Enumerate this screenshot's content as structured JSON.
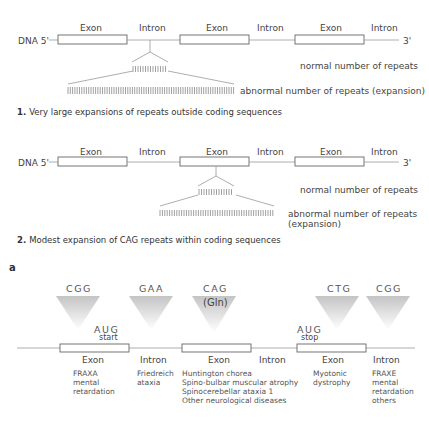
{
  "panel1": {
    "dna_label": "DNA 5'",
    "end_label": "3'",
    "segments": [
      "Exon",
      "Intron",
      "Exon",
      "Intron",
      "Exon",
      "Intron"
    ],
    "normal_label": "normal number of repeats",
    "abnormal_label": "abnormal number of repeats (expansion)",
    "caption_num": "1.",
    "caption_text": "Very large expansions of repeats outside coding sequences"
  },
  "panel2": {
    "dna_label": "DNA 5'",
    "end_label": "3'",
    "segments": [
      "Exon",
      "Intron",
      "Exon",
      "Intron",
      "Exon",
      "Intron"
    ],
    "normal_label": "normal number of repeats",
    "abnormal_label_line1": "abnormal number of repeats",
    "abnormal_label_line2": "(expansion)",
    "caption_num": "2.",
    "caption_text": "Modest expansion of CAG repeats within coding sequences"
  },
  "panel_letter": "a",
  "panel3": {
    "codons": [
      {
        "seq": "CGG",
        "sub": ""
      },
      {
        "seq": "GAA",
        "sub": ""
      },
      {
        "seq": "CAG",
        "sub": "(Gln)"
      },
      {
        "seq": "CTG",
        "sub": ""
      },
      {
        "seq": "CGG",
        "sub": ""
      }
    ],
    "aug_start": {
      "codon": "AUG",
      "label": "start"
    },
    "aug_stop": {
      "codon": "AUG",
      "label": "stop"
    },
    "segments": [
      "Exon",
      "Intron",
      "Exon",
      "Intron",
      "Exon",
      "Intron"
    ],
    "diseases": {
      "exon1": [
        "FRAXA",
        "mental",
        "retardation"
      ],
      "intron1": [
        "Friedreich",
        "ataxia"
      ],
      "exon2": [
        "Huntington chorea",
        "Spino-bulbar muscular atrophy",
        "Spinocerebellar ataxia 1",
        "Other neurological diseases"
      ],
      "exon3": [
        "Myotonic",
        "dystrophy"
      ],
      "intron3": [
        "FRAXE",
        "mental",
        "retardation",
        "others"
      ]
    }
  },
  "colors": {
    "funnel": "#c8c8c8",
    "line": "#999999",
    "text": "#444444"
  }
}
